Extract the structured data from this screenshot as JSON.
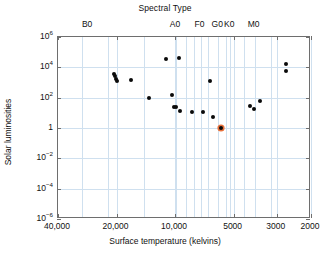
{
  "chart_data": {
    "type": "scatter",
    "title": "Spectral Type",
    "xlabel": "Surface temperature (kelvins)",
    "ylabel": "Solar luminosities",
    "xscale": "log",
    "yscale": "log",
    "xlim": [
      40000,
      2000
    ],
    "ylim": [
      1e-06,
      1000000.0
    ],
    "x_inverted": true,
    "grid": true,
    "legend": "none",
    "xticklabels": [
      "40,000",
      "20,000",
      "10,000",
      "5000",
      "3000",
      "2000"
    ],
    "xtickvalues": [
      40000,
      20000,
      10000,
      5000,
      3000,
      2000
    ],
    "yticklabels": [
      "10⁶",
      "10⁴",
      "10²",
      "1",
      "10⁻²",
      "10⁻⁴",
      "10⁻⁶"
    ],
    "ytickvalues": [
      1000000,
      10000,
      100,
      1,
      0.01,
      0.0001,
      1e-06
    ],
    "top_axis_label": "Spectral Type",
    "spectral_types": [
      {
        "label": "B0",
        "temperature": 28000
      },
      {
        "label": "A0",
        "temperature": 9900
      },
      {
        "label": "F0",
        "temperature": 7400
      },
      {
        "label": "G0",
        "temperature": 6000
      },
      {
        "label": "K0",
        "temperature": 5200
      },
      {
        "label": "M0",
        "temperature": 3900
      }
    ],
    "spectral_tick_temperatures": [
      30000,
      22000,
      14500,
      9900,
      8800,
      8000,
      7400,
      6800,
      6000,
      5500,
      5200,
      4400,
      3900,
      3200
    ],
    "series": [
      {
        "name": "Stars",
        "marker": "filled-circle",
        "color": "#0a0a0a",
        "points": [
          {
            "t": 20600,
            "L": 3500
          },
          {
            "t": 20400,
            "L": 2600
          },
          {
            "t": 20100,
            "L": 1700
          },
          {
            "t": 19900,
            "L": 1250
          },
          {
            "t": 16800,
            "L": 1500
          },
          {
            "t": 13600,
            "L": 100
          },
          {
            "t": 11200,
            "L": 36000
          },
          {
            "t": 9600,
            "L": 43000
          },
          {
            "t": 10400,
            "L": 160
          },
          {
            "t": 10100,
            "L": 26
          },
          {
            "t": 9900,
            "L": 23
          },
          {
            "t": 9400,
            "L": 13
          },
          {
            "t": 8200,
            "L": 11
          },
          {
            "t": 7200,
            "L": 11
          },
          {
            "t": 6600,
            "L": 1250
          },
          {
            "t": 6400,
            "L": 5.5
          },
          {
            "t": 4100,
            "L": 28
          },
          {
            "t": 3950,
            "L": 18
          },
          {
            "t": 3650,
            "L": 65
          },
          {
            "t": 2700,
            "L": 16000
          },
          {
            "t": 2680,
            "L": 5500
          }
        ]
      },
      {
        "name": "The Sun",
        "marker": "highlighted-circle",
        "color": "#e8703a",
        "points": [
          {
            "t": 5800,
            "L": 1.0
          }
        ]
      }
    ]
  }
}
